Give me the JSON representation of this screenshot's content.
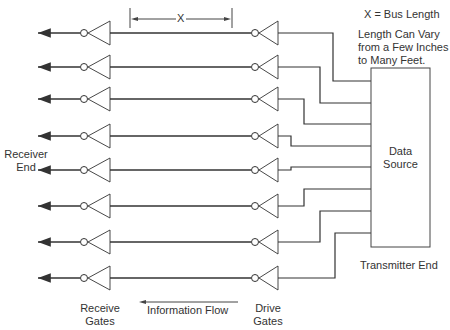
{
  "diagram": {
    "annotations": {
      "bus_length_def": "X = Bus Length",
      "length_note_line1": "Length Can Vary",
      "length_note_line2": "from a Few Inches",
      "length_note_line3": "to Many Feet.",
      "dimension_label": "X"
    },
    "labels": {
      "receiver_end_line1": "Receiver",
      "receiver_end_line2": "End",
      "receive_gates_line1": "Receive",
      "receive_gates_line2": "Gates",
      "drive_gates_line1": "Drive",
      "drive_gates_line2": "Gates",
      "information_flow": "Information Flow",
      "transmitter_end": "Transmitter End",
      "data_source_line1": "Data",
      "data_source_line2": "Source"
    },
    "lines": [
      {
        "y": 33,
        "bend_x": 333,
        "box_y": 81
      },
      {
        "y": 67,
        "bend_x": 320,
        "box_y": 103
      },
      {
        "y": 99,
        "bend_x": 304,
        "box_y": 124
      },
      {
        "y": 136,
        "bend_x": 291,
        "box_y": 146
      },
      {
        "y": 170,
        "bend_x": 291,
        "box_y": 167
      },
      {
        "y": 206,
        "bend_x": 304,
        "box_y": 189
      },
      {
        "y": 242,
        "bend_x": 320,
        "box_y": 211
      },
      {
        "y": 278,
        "bend_x": 335,
        "box_y": 233
      }
    ],
    "colors": {
      "line": "#333333",
      "background": "#ffffff"
    }
  }
}
